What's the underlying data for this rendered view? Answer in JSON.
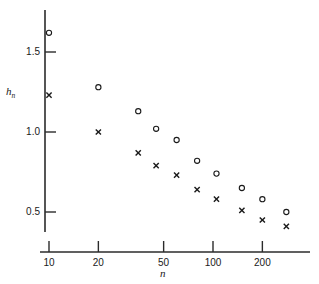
{
  "chart_data": {
    "type": "scatter",
    "title": "",
    "subtitle": "",
    "xlabel": "n",
    "ylabel": "h_n",
    "xscale": "log",
    "yscale": "linear",
    "xlim": [
      8.2,
      330
    ],
    "ylim": [
      0.36,
      1.72
    ],
    "grid": false,
    "legend_position": "none",
    "x_ticks": [
      10,
      20,
      50,
      100,
      200
    ],
    "x_tick_labels": [
      "10",
      "20",
      "50",
      "100",
      "200"
    ],
    "y_ticks": [
      0.5,
      1.0,
      1.5
    ],
    "y_tick_labels": [
      "0.5",
      "1.0",
      "1.5"
    ],
    "series": [
      {
        "name": "circle-series",
        "marker": "o",
        "color": "#1a1a1a",
        "x": [
          10,
          20,
          35,
          45,
          60,
          80,
          105,
          150,
          200,
          280
        ],
        "y": [
          1.62,
          1.28,
          1.13,
          1.02,
          0.95,
          0.82,
          0.74,
          0.65,
          0.58,
          0.5
        ]
      },
      {
        "name": "cross-series",
        "marker": "x",
        "color": "#1a1a1a",
        "x": [
          10,
          20,
          35,
          45,
          60,
          80,
          105,
          150,
          200,
          280
        ],
        "y": [
          1.23,
          1.0,
          0.87,
          0.79,
          0.73,
          0.64,
          0.58,
          0.51,
          0.45,
          0.41
        ]
      }
    ],
    "annotations": []
  },
  "axis_titles": {
    "y_main": "h",
    "y_sub": "n",
    "x_main": "n"
  },
  "colors": {
    "axis": "#2b2b2b",
    "marker": "#1a1a1a",
    "background": "#ffffff"
  }
}
